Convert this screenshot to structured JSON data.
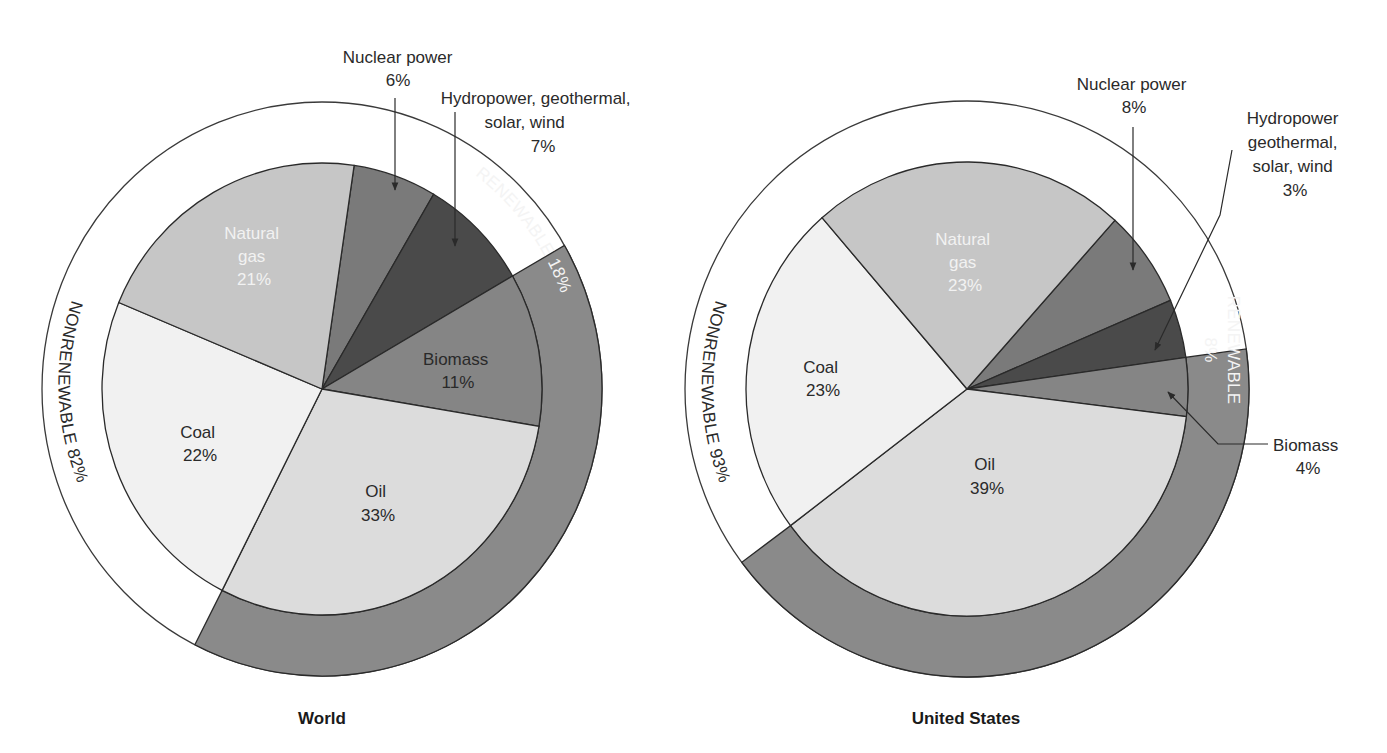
{
  "chart_data": [
    {
      "type": "pie",
      "title": "World",
      "slices": [
        {
          "label": "Natural gas",
          "value": 21,
          "color": "#7a7a7a"
        },
        {
          "label": "Nuclear power",
          "value": 6,
          "color": "#4a4a4a"
        },
        {
          "label": "Hydropower, geothermal, solar, wind",
          "value": 7,
          "color": "#858585"
        },
        {
          "label": "Biomass",
          "value": 11,
          "color": "#dcdcdc"
        },
        {
          "label": "Oil",
          "value": 33,
          "color": "#f1f1f1"
        },
        {
          "label": "Coal",
          "value": 22,
          "color": "#c6c6c6"
        }
      ],
      "groups": [
        {
          "label": "NONRENEWABLE",
          "value": 82
        },
        {
          "label": "RENEWABLE",
          "value": 18
        }
      ]
    },
    {
      "type": "pie",
      "title": "United States",
      "slices": [
        {
          "label": "Natural gas",
          "value": 23,
          "color": "#7a7a7a"
        },
        {
          "label": "Nuclear power",
          "value": 8,
          "color": "#4a4a4a"
        },
        {
          "label": "Hydropower geothermal, solar, wind",
          "value": 3,
          "color": "#858585"
        },
        {
          "label": "Biomass",
          "value": 4,
          "color": "#dcdcdc"
        },
        {
          "label": "Oil",
          "value": 39,
          "color": "#f1f1f1"
        },
        {
          "label": "Coal",
          "value": 23,
          "color": "#c6c6c6"
        }
      ],
      "groups": [
        {
          "label": "NONRENEWABLE",
          "value": 93
        },
        {
          "label": "RENEWABLE",
          "value": 8
        }
      ]
    }
  ],
  "colors": {
    "renewable_ring": "#8a8a8a",
    "outline": "#2a2a2a"
  },
  "world": {
    "title": "World",
    "center": [
      322,
      389
    ],
    "pie_r": [
      220,
      226
    ],
    "ring_r": [
      280,
      287
    ],
    "angles": [
      -81.6,
      -59.5,
      -30,
      9.5,
      117,
      202.5
    ],
    "labels": {
      "gas_1": "Natural",
      "gas_2": "gas",
      "gas_pct": "21%",
      "coal_1": "Coal",
      "coal_pct": "22%",
      "oil_1": "Oil",
      "oil_pct": "33%",
      "biomass_1": "Biomass",
      "biomass_pct": "11%",
      "nuclear_1": "Nuclear power",
      "nuclear_pct": "6%",
      "hydro_1": "Hydropower, geothermal,",
      "hydro_2": "solar, wind",
      "hydro_pct": "7%",
      "renewable": "RENEWABLE 18%",
      "nonrenewable": "NONRENEWABLE 82%"
    }
  },
  "us": {
    "title": "United States",
    "center": [
      967,
      389
    ],
    "pie_r": [
      221,
      227
    ],
    "ring_r": [
      282,
      288
    ],
    "angles": [
      -48,
      -23,
      -8,
      7,
      143,
      229
    ],
    "labels": {
      "gas_1": "Natural",
      "gas_2": "gas",
      "gas_pct": "23%",
      "coal_1": "Coal",
      "coal_pct": "23%",
      "oil_1": "Oil",
      "oil_pct": "39%",
      "biomass_1": "Biomass",
      "biomass_pct": "4%",
      "nuclear_1": "Nuclear power",
      "nuclear_pct": "8%",
      "hydro_1": "Hydropower",
      "hydro_2": "geothermal,",
      "hydro_3": "solar, wind",
      "hydro_pct": "3%",
      "renewable_1": "RENEWABLE",
      "renewable_2": "8%",
      "nonrenewable": "NONRENEWABLE 93%"
    }
  }
}
